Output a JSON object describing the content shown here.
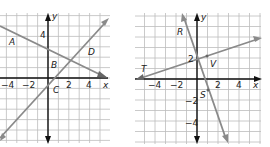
{
  "graphs": [
    {
      "id": "left",
      "x_axis_label": "x",
      "y_axis_label": "y",
      "x_ticks": [
        {
          "v": -4,
          "label": "−4"
        },
        {
          "v": -2,
          "label": "−2"
        },
        {
          "v": 2,
          "label": "2"
        },
        {
          "v": 4,
          "label": "4"
        }
      ],
      "y_ticks": [
        {
          "v": 4,
          "label": "4"
        }
      ],
      "lines": [
        {
          "name": "line-AD",
          "equation": "y = -0.5x + 2.5",
          "slope": -0.5,
          "intercept": 2.5
        },
        {
          "name": "line-CD",
          "equation": "y = x - 1",
          "slope": 1,
          "intercept": -1
        }
      ],
      "points": [
        {
          "label": "A",
          "x": -3,
          "y": 4
        },
        {
          "label": "B",
          "x": 1,
          "y": 1.5
        },
        {
          "label": "C",
          "x": 0,
          "y": -1
        },
        {
          "label": "D",
          "x": 4,
          "y": 3
        }
      ]
    },
    {
      "id": "right",
      "x_axis_label": "x",
      "y_axis_label": "y",
      "x_ticks": [
        {
          "v": -4,
          "label": "−4"
        },
        {
          "v": -2,
          "label": "−2"
        },
        {
          "v": 2,
          "label": "2"
        },
        {
          "v": 4,
          "label": "4"
        }
      ],
      "y_ticks": [
        {
          "v": 2,
          "label": "2"
        },
        {
          "v": -2,
          "label": "−2"
        },
        {
          "v": -4,
          "label": "−4"
        }
      ],
      "lines": [
        {
          "name": "line-TV",
          "equation": "y = 0.4x + 2",
          "slope": 0.4,
          "intercept": 2
        },
        {
          "name": "line-RS",
          "equation": "y = -3x + 2",
          "slope": -3,
          "intercept": 2
        }
      ],
      "points": [
        {
          "label": "T",
          "x": -5,
          "y": 0
        },
        {
          "label": "V",
          "x": 1,
          "y": 2.4
        },
        {
          "label": "R",
          "x": -1,
          "y": 5
        },
        {
          "label": "S",
          "x": 1,
          "y": -1
        }
      ]
    }
  ],
  "colors": {
    "grid": "#bdbdbd",
    "axis": "#111111",
    "line": "#8a8a8a",
    "text": "#222222"
  }
}
